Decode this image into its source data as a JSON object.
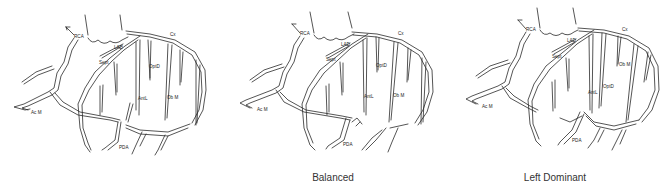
{
  "figure": {
    "panels": [
      {
        "caption": "",
        "labels": {
          "rca": "RCA",
          "lad": "LAD",
          "cx": "Cx",
          "sept": "Sept",
          "optd": "OptD",
          "antl": "AntL",
          "obm": "Ob M",
          "acm": "Ac M",
          "pda": "PDA"
        }
      },
      {
        "caption": "Balanced",
        "labels": {
          "rca": "RCA",
          "lad": "LAD",
          "cx": "Cx",
          "sept": "Sept",
          "optd": "OptD",
          "antl": "AntL",
          "obm": "Ob M",
          "acm": "Ac M",
          "pda": "PDA"
        }
      },
      {
        "caption": "Left Dominant",
        "labels": {
          "rca": "RCA",
          "lad": "LAD",
          "cx": "Cx",
          "sept": "Sept",
          "optd": "OptD",
          "antl": "AntL",
          "obm": "Ob M",
          "acm": "Ac M",
          "pda": "PDA"
        }
      }
    ]
  }
}
